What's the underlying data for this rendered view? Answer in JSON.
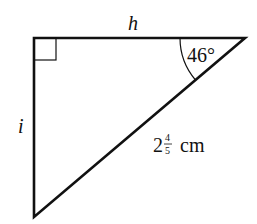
{
  "diagram": {
    "type": "right-triangle",
    "vertices": {
      "right_angle": [
        34,
        38
      ],
      "top_right": [
        245,
        38
      ],
      "bottom": [
        34,
        217
      ]
    },
    "labels": {
      "top_side": "h",
      "left_side": "i",
      "angle": "46°",
      "hypotenuse_whole": "2",
      "hypotenuse_num": "4",
      "hypotenuse_den": "5",
      "hypotenuse_unit": "cm"
    },
    "colors": {
      "stroke": "#111111",
      "background": "#ffffff"
    }
  }
}
